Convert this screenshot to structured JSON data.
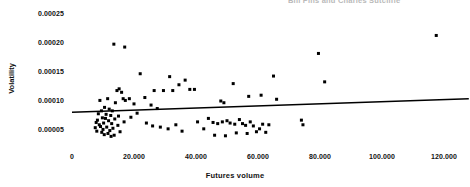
{
  "figure": {
    "running_header": "Bill Pins and Charles Sutcliffe",
    "background_color": "#ffffff",
    "marker_color": "#000000",
    "trendline_color": "#000000"
  },
  "chart_data": {
    "type": "scatter",
    "title": "",
    "subtitle": "",
    "xlabel": "Futures volume",
    "ylabel": "Volatility",
    "grid": false,
    "legend": null,
    "xlim": [
      0,
      128000
    ],
    "ylim": [
      2e-05,
      0.00026
    ],
    "xticks": [
      0,
      20000,
      40000,
      60000,
      80000,
      100000,
      120000
    ],
    "xtick_labels": [
      "0",
      "20.000",
      "40.000",
      "60.000",
      "80.000",
      "100.000",
      "120.000"
    ],
    "yticks": [
      5e-05,
      0.0001,
      0.00015,
      0.0002,
      0.00025
    ],
    "ytick_labels": [
      "0.00005",
      "0.00010",
      "0.00015",
      "0.00020",
      "0.00025"
    ],
    "marker": "square",
    "marker_size": 3,
    "series": [
      {
        "name": "observations",
        "points": [
          [
            13500,
            0.000198
          ],
          [
            17000,
            0.000193
          ],
          [
            22000,
            0.000147
          ],
          [
            31500,
            0.000142
          ],
          [
            34500,
            0.000128
          ],
          [
            36500,
            0.000136
          ],
          [
            14500,
            0.000118
          ],
          [
            15200,
            0.000121
          ],
          [
            16000,
            0.000115
          ],
          [
            26500,
            0.000118
          ],
          [
            29500,
            0.000118
          ],
          [
            32500,
            0.000118
          ],
          [
            38000,
            0.00012
          ],
          [
            39500,
            0.00012
          ],
          [
            11500,
            0.000104
          ],
          [
            16500,
            0.000104
          ],
          [
            17200,
            0.000101
          ],
          [
            18500,
            0.000104
          ],
          [
            23500,
            0.000106
          ],
          [
            9000,
            0.000101
          ],
          [
            14000,
            9.7e-05
          ],
          [
            20000,
            9.5e-05
          ],
          [
            10500,
            8.9e-05
          ],
          [
            25500,
            9.3e-05
          ],
          [
            27500,
            8.7e-05
          ],
          [
            12000,
            8.6e-05
          ],
          [
            9500,
            8.3e-05
          ],
          [
            13000,
            8.3e-05
          ],
          [
            21000,
            7.9e-05
          ],
          [
            8500,
            7.8e-05
          ],
          [
            11000,
            7.7e-05
          ],
          [
            12500,
            7.5e-05
          ],
          [
            15000,
            7.4e-05
          ],
          [
            19000,
            7.2e-05
          ],
          [
            9800,
            7.1e-05
          ],
          [
            10800,
            7e-05
          ],
          [
            13800,
            6.9e-05
          ],
          [
            8200,
            6.7e-05
          ],
          [
            11800,
            6.6e-05
          ],
          [
            16800,
            6.4e-05
          ],
          [
            7800,
            6.3e-05
          ],
          [
            10200,
            6.2e-05
          ],
          [
            12800,
            6.1e-05
          ],
          [
            8800,
            5.9e-05
          ],
          [
            14800,
            5.8e-05
          ],
          [
            9200,
            5.6e-05
          ],
          [
            11200,
            5.5e-05
          ],
          [
            7500,
            5.4e-05
          ],
          [
            13200,
            5.3e-05
          ],
          [
            10000,
            5.1e-05
          ],
          [
            12200,
            4.9e-05
          ],
          [
            8000,
            4.8e-05
          ],
          [
            15500,
            4.7e-05
          ],
          [
            9600,
            4.6e-05
          ],
          [
            11600,
            4.4e-05
          ],
          [
            10400,
            4.2e-05
          ],
          [
            13600,
            4.1e-05
          ],
          [
            12600,
            3.9e-05
          ],
          [
            24000,
            6.2e-05
          ],
          [
            26000,
            5.7e-05
          ],
          [
            28500,
            5.5e-05
          ],
          [
            31000,
            5.2e-05
          ],
          [
            33500,
            5.9e-05
          ],
          [
            35500,
            4.8e-05
          ],
          [
            40500,
            6.4e-05
          ],
          [
            42500,
            5.2e-05
          ],
          [
            44000,
            7e-05
          ],
          [
            45500,
            6.3e-05
          ],
          [
            47000,
            6.1e-05
          ],
          [
            48500,
            6.4e-05
          ],
          [
            50000,
            6.6e-05
          ],
          [
            51000,
            6.2e-05
          ],
          [
            52500,
            6e-05
          ],
          [
            54000,
            6.8e-05
          ],
          [
            55000,
            6.1e-05
          ],
          [
            56000,
            5.8e-05
          ],
          [
            57500,
            6.4e-05
          ],
          [
            58500,
            5.7e-05
          ],
          [
            46000,
            4.1e-05
          ],
          [
            49500,
            4e-05
          ],
          [
            53000,
            4.5e-05
          ],
          [
            56500,
            4.4e-05
          ],
          [
            59500,
            4.7e-05
          ],
          [
            61500,
            6e-05
          ],
          [
            63500,
            5.9e-05
          ],
          [
            60500,
            5.2e-05
          ],
          [
            62500,
            4.6e-05
          ],
          [
            48000,
            0.0001
          ],
          [
            49000,
            9.7e-05
          ],
          [
            52000,
            0.00013
          ],
          [
            57000,
            0.000108
          ],
          [
            61000,
            0.00011
          ],
          [
            65000,
            0.000143
          ],
          [
            66000,
            0.000103
          ],
          [
            74000,
            6.7e-05
          ],
          [
            74500,
            5.9e-05
          ],
          [
            79500,
            0.000182
          ],
          [
            81500,
            0.000133
          ],
          [
            117500,
            0.000213
          ]
        ]
      }
    ],
    "trendline": {
      "name": "fitted regression line",
      "x_start": 0,
      "y_start": 8.05e-05,
      "x_end": 128000,
      "y_end": 0.000104
    }
  }
}
